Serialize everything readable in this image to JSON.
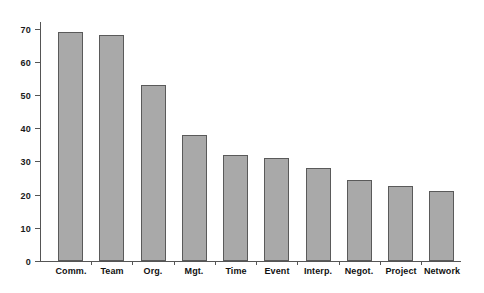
{
  "chart_data": {
    "type": "bar",
    "title": "",
    "subtitle": "",
    "xlabel": "",
    "ylabel": "",
    "categories": [
      "Comm.",
      "Team",
      "Org.",
      "Mgt.",
      "Time",
      "Event",
      "Interp.",
      "Negot.",
      "Project",
      "Network"
    ],
    "values": [
      69,
      68,
      53,
      38,
      32,
      31,
      28,
      24.5,
      22.5,
      21
    ],
    "ylim": [
      0,
      72
    ],
    "yticks": [
      0,
      10,
      20,
      30,
      40,
      50,
      60,
      70
    ],
    "ytick_labels": [
      "0",
      "10",
      "20",
      "30",
      "40",
      "50",
      "60",
      "70"
    ],
    "grid": false,
    "legend": null,
    "legend_position": "none",
    "bar_fill": "#a9a9a9",
    "bar_edge": "#5a5a5a",
    "axis_color": "#555555",
    "background": "#ffffff"
  }
}
